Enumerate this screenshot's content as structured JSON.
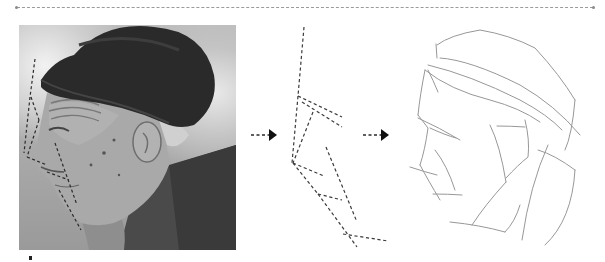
{
  "figure": {
    "panels": [
      {
        "id": "photo",
        "label": "Reference photograph with dashed contour guides"
      },
      {
        "id": "dashed-lines",
        "label": "Extracted dashed guide lines"
      },
      {
        "id": "sketch",
        "label": "Pencil sketch of head and cap"
      }
    ],
    "arrows": [
      {
        "from": "photo",
        "to": "dashed-lines",
        "style": "dashed-arrow"
      },
      {
        "from": "dashed-lines",
        "to": "sketch",
        "style": "dashed-arrow"
      }
    ],
    "colors": {
      "dash": "#3a3a3a",
      "sketch": "#8c8c8c",
      "rule": "#9a9a9a",
      "arrow": "#1a1a1a"
    }
  }
}
